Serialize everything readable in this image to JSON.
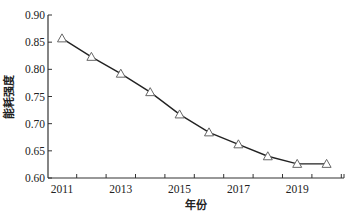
{
  "chart_data": {
    "type": "line",
    "title": "",
    "xlabel": "年份",
    "ylabel": "能耗强度",
    "x": [
      2011,
      2012,
      2013,
      2014,
      2015,
      2016,
      2017,
      2018,
      2019,
      2020
    ],
    "series": [
      {
        "name": "能耗强度",
        "values": [
          0.857,
          0.823,
          0.792,
          0.758,
          0.717,
          0.684,
          0.662,
          0.64,
          0.626,
          0.626
        ],
        "marker": "triangle-open",
        "color": "#333333"
      }
    ],
    "ylim": [
      0.6,
      0.9
    ],
    "xlim": [
      2010.5,
      2020.7
    ],
    "yticks": [
      "0.60",
      "0.65",
      "0.70",
      "0.75",
      "0.80",
      "0.85",
      "0.90"
    ],
    "xticks": [
      "2011",
      "2013",
      "2015",
      "2017",
      "2019"
    ],
    "grid": false,
    "legend": null
  }
}
